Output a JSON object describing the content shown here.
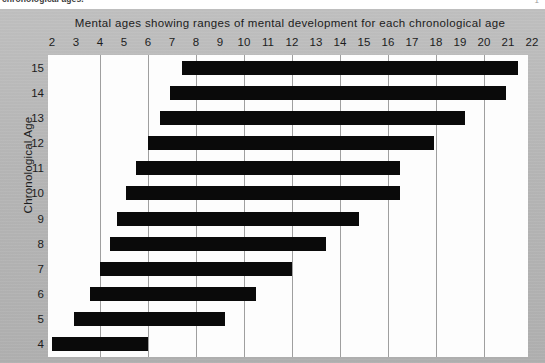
{
  "caption": {
    "text": "chronological ages.",
    "page_mark": "1"
  },
  "chart": {
    "title": "Mental ages showing ranges of mental development for each chronological age",
    "y_axis_title": "Chronological Age",
    "colors": {
      "bar": "#0a0a0a",
      "panel": "#b9b9b9",
      "plot_background": "#fdfdfd",
      "gridline": "#9f9f9f",
      "text": "#1c1c1c"
    }
  },
  "chart_data": {
    "type": "bar",
    "orientation": "horizontal",
    "title": "Mental ages showing ranges of mental development for each chronological age",
    "xlabel": "",
    "ylabel": "Chronological Age",
    "xlim": [
      2,
      22
    ],
    "ylim": [
      4,
      15
    ],
    "grid": true,
    "legend": null,
    "x_ticks": [
      2,
      3,
      4,
      5,
      6,
      7,
      8,
      9,
      10,
      11,
      12,
      13,
      14,
      15,
      16,
      17,
      18,
      19,
      20,
      21,
      22
    ],
    "gridline_values": [
      4,
      6,
      8,
      10,
      12,
      14,
      16,
      18,
      20,
      22
    ],
    "y_ticks": [
      15,
      14,
      13,
      12,
      11,
      10,
      9,
      8,
      7,
      6,
      5,
      4
    ],
    "categories": [
      "15",
      "14",
      "13",
      "12",
      "11",
      "10",
      "9",
      "8",
      "7",
      "6",
      "5",
      "4"
    ],
    "ranges": [
      {
        "category": "15",
        "start": 7.4,
        "end": 21.4
      },
      {
        "category": "14",
        "start": 6.9,
        "end": 20.9
      },
      {
        "category": "13",
        "start": 6.5,
        "end": 19.2
      },
      {
        "category": "12",
        "start": 6.0,
        "end": 17.9
      },
      {
        "category": "11",
        "start": 5.5,
        "end": 16.5
      },
      {
        "category": "10",
        "start": 5.1,
        "end": 16.5
      },
      {
        "category": "9",
        "start": 4.7,
        "end": 14.8
      },
      {
        "category": "8",
        "start": 4.4,
        "end": 13.4
      },
      {
        "category": "7",
        "start": 4.0,
        "end": 12.0
      },
      {
        "category": "6",
        "start": 3.6,
        "end": 10.5
      },
      {
        "category": "5",
        "start": 2.9,
        "end": 9.2
      },
      {
        "category": "4",
        "start": 2.0,
        "end": 6.0
      }
    ]
  }
}
